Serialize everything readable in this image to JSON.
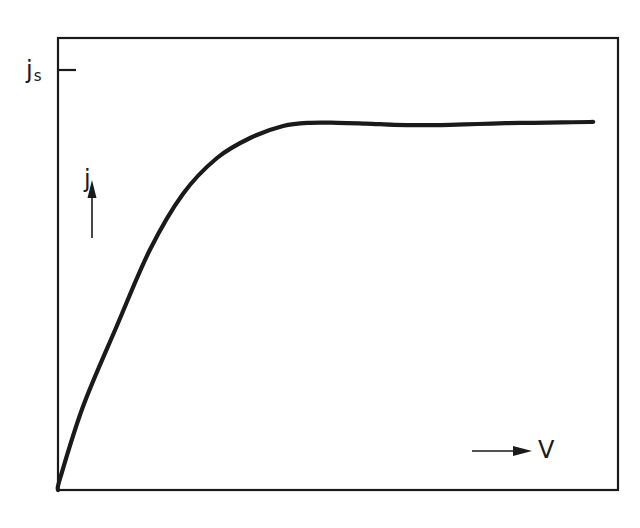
{
  "chart_data": {
    "type": "line",
    "title": "",
    "xlabel": "V",
    "ylabel": "j",
    "y_tick_labels": [
      {
        "label": "j_s",
        "main": "j",
        "sub": "s",
        "meaning": "saturation current density"
      }
    ],
    "grid": false,
    "legend": null,
    "axis_ranges": {
      "x": [
        0,
        1
      ],
      "y": [
        0,
        1.13
      ]
    },
    "annotations": [
      "arrow up next to j",
      "arrow right next to V"
    ],
    "series": [
      {
        "name": "j(V)",
        "x": [
          0.0,
          0.004,
          0.045,
          0.105,
          0.164,
          0.223,
          0.284,
          0.343,
          0.402,
          0.45,
          0.5,
          0.55,
          0.6,
          0.65,
          0.7,
          0.75,
          0.8,
          0.85,
          0.9,
          0.95,
          0.955
        ],
        "y": [
          0.0,
          0.03,
          0.21,
          0.41,
          0.6,
          0.74,
          0.83,
          0.88,
          0.91,
          0.918,
          0.918,
          0.916,
          0.913,
          0.912,
          0.913,
          0.915,
          0.917,
          0.918,
          0.919,
          0.92,
          0.92
        ]
      }
    ],
    "saturation_level": 0.93,
    "color": "#1a1a1a"
  },
  "labels": {
    "y_axis": "j",
    "x_axis": "V",
    "js_main": "j",
    "js_sub": "s"
  }
}
